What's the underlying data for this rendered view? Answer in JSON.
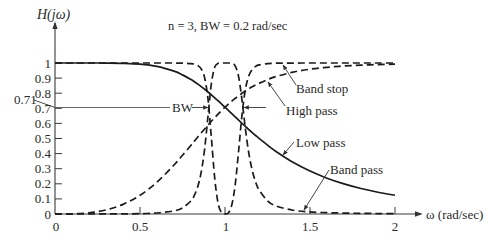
{
  "chart_data": {
    "type": "line",
    "title": "n = 3, BW = 0.2 rad/sec",
    "xlabel": "ω (rad/sec)",
    "ylabel": "H(jω)",
    "xlim": [
      0,
      2
    ],
    "ylim": [
      0,
      1
    ],
    "grid": false,
    "legend": "inline leader-line annotations",
    "x_ticks": [
      "0",
      "0.5",
      "1",
      "1.5",
      "2"
    ],
    "y_ticks": [
      "0",
      "0.1",
      "0.2",
      "0.3",
      "0.4",
      "0.5",
      "0.6",
      "0.7",
      "0.8",
      "0.9",
      "1"
    ],
    "x": [
      0,
      0.1,
      0.2,
      0.3,
      0.4,
      0.5,
      0.6,
      0.7,
      0.75,
      0.8,
      0.82,
      0.84,
      0.86,
      0.88,
      0.9,
      0.92,
      0.94,
      0.96,
      0.98,
      1.0,
      1.02,
      1.04,
      1.06,
      1.08,
      1.1,
      1.12,
      1.14,
      1.16,
      1.18,
      1.2,
      1.25,
      1.3,
      1.4,
      1.5,
      1.6,
      1.7,
      1.8,
      1.9,
      2.0
    ],
    "series": [
      {
        "name": "Band stop",
        "style": "dashed",
        "values": [
          1.0,
          1.0,
          1.0,
          1.0,
          1.0,
          1.0,
          1.0,
          0.9998,
          0.9992,
          0.9962,
          0.9922,
          0.9832,
          0.9609,
          0.9033,
          0.7618,
          0.5029,
          0.2309,
          0.0679,
          0.0082,
          0.0,
          0.0078,
          0.0603,
          0.1944,
          0.4159,
          0.6563,
          0.8259,
          0.9151,
          0.9572,
          0.9772,
          0.9871,
          0.9962,
          0.9986,
          0.9997,
          0.9999,
          1.0,
          1.0,
          1.0,
          1.0,
          1.0
        ]
      },
      {
        "name": "High pass",
        "style": "dashed",
        "values": [
          0,
          0.001,
          0.008,
          0.027,
          0.0639,
          0.124,
          0.2111,
          0.3244,
          0.3887,
          0.4557,
          0.4828,
          0.5099,
          0.5367,
          0.5632,
          0.5891,
          0.6144,
          0.639,
          0.6627,
          0.6854,
          0.7071,
          0.7278,
          0.7474,
          0.7658,
          0.7832,
          0.7995,
          0.8147,
          0.8289,
          0.842,
          0.8542,
          0.8655,
          0.8901,
          0.9102,
          0.9396,
          0.9589,
          0.9715,
          0.9801,
          0.9856,
          0.9896,
          0.9923
        ]
      },
      {
        "name": "Band pass",
        "style": "dashed",
        "values": [
          0,
          0,
          0.0001,
          0.0003,
          0.0009,
          0.0024,
          0.0066,
          0.0207,
          0.0403,
          0.0875,
          0.1245,
          0.1827,
          0.2769,
          0.4289,
          0.6478,
          0.8644,
          0.973,
          0.9977,
          1.0,
          1.0,
          1.0,
          0.9982,
          0.9809,
          0.9094,
          0.7545,
          0.5638,
          0.4033,
          0.2895,
          0.2126,
          0.1602,
          0.0875,
          0.0534,
          0.0248,
          0.0138,
          0.0086,
          0.0058,
          0.0042,
          0.0031,
          0.0024
        ]
      },
      {
        "name": "Low pass",
        "style": "solid",
        "values": [
          1.0,
          1.0,
          1.0,
          0.9996,
          0.998,
          0.9923,
          0.9775,
          0.9459,
          0.9214,
          0.8901,
          0.8757,
          0.8603,
          0.8438,
          0.8264,
          0.8081,
          0.789,
          0.7693,
          0.749,
          0.7282,
          0.7071,
          0.6858,
          0.6644,
          0.643,
          0.6217,
          0.6007,
          0.5799,
          0.5595,
          0.5394,
          0.5199,
          0.5009,
          0.4557,
          0.4143,
          0.3424,
          0.2841,
          0.2372,
          0.1995,
          0.169,
          0.1443,
          0.124
        ]
      }
    ],
    "annotations": {
      "half_power_level": "0.71",
      "bandwidth": "BW",
      "band_stop": "Band stop",
      "high_pass": "High pass",
      "low_pass": "Low pass",
      "band_pass": "Band pass"
    },
    "colors": {
      "lines": "#1b1b1b",
      "text": "#2a2a2a",
      "background": "#ffffff"
    }
  }
}
